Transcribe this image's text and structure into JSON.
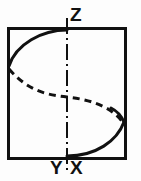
{
  "figure": {
    "background_color": "#fdfdfd",
    "ink_color": "#111111",
    "labels": {
      "z": "Z",
      "y": "Y",
      "x": "X"
    },
    "frame": {
      "name": "bounding-rectangle",
      "x": 8,
      "y": 28,
      "width": 117,
      "height": 130,
      "stroke_width": 3,
      "stroke_color": "#111111"
    },
    "axis": {
      "name": "vertical-center-axis",
      "style": "dash-dot",
      "x": 67,
      "y_top": 18,
      "y_bottom": 170,
      "stroke_width": 2,
      "stroke_color": "#111111"
    },
    "curves": {
      "solid_upper": {
        "name": "helix-front-upper-arc",
        "style": "solid",
        "path": "M 9 66 C 16 44 42 30 67 30",
        "stroke_width": 3
      },
      "solid_lower": {
        "name": "helix-front-lower-arc",
        "style": "solid",
        "path": "M 67 156 C 96 156 116 140 124 122",
        "stroke_width": 3
      },
      "solid_right_cap": {
        "name": "helix-front-right-cap",
        "style": "solid",
        "path": "M 124 122 C 121 116 117 112 112 109",
        "stroke_width": 3
      },
      "dashed_back": {
        "name": "helix-back-dashed-curve",
        "style": "dashed",
        "path": "M 9 69 C 30 92 48 95 67 97 C 95 100 114 110 124 124",
        "stroke_width": 3,
        "dash_pattern": "7 5"
      }
    }
  }
}
